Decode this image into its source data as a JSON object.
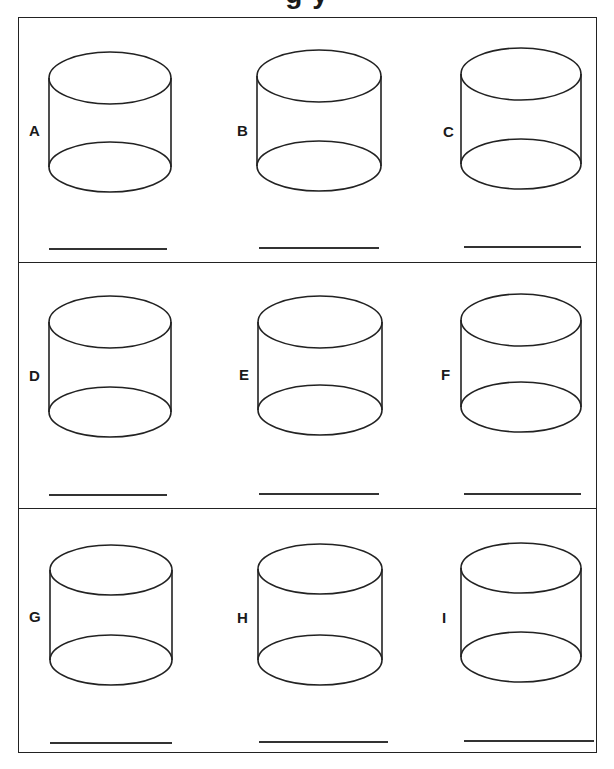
{
  "worksheet": {
    "title_fragment": "g      y",
    "rows": [
      {
        "cells": [
          {
            "label": "A",
            "answer": ""
          },
          {
            "label": "B",
            "answer": ""
          },
          {
            "label": "C",
            "answer": ""
          }
        ]
      },
      {
        "cells": [
          {
            "label": "D",
            "answer": ""
          },
          {
            "label": "E",
            "answer": ""
          },
          {
            "label": "F",
            "answer": ""
          }
        ]
      },
      {
        "cells": [
          {
            "label": "G",
            "answer": ""
          },
          {
            "label": "H",
            "answer": ""
          },
          {
            "label": "I",
            "answer": ""
          }
        ]
      }
    ],
    "shape_icon": "cylinder-outline",
    "colors": {
      "ink": "#222222",
      "paper": "#ffffff"
    }
  }
}
